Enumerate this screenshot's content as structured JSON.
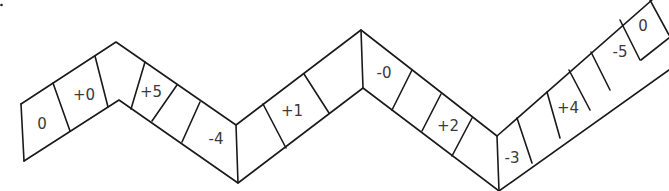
{
  "board": {
    "type": "zigzag number track",
    "cells": [
      {
        "index": 0,
        "label": "0",
        "x": 42,
        "y": 124
      },
      {
        "index": 1,
        "label": "+0",
        "x": 84,
        "y": 95
      },
      {
        "index": 2,
        "label": "",
        "x": 122,
        "y": 72
      },
      {
        "index": 3,
        "label": "+5",
        "x": 151,
        "y": 92
      },
      {
        "index": 4,
        "label": "",
        "x": 176,
        "y": 112
      },
      {
        "index": 5,
        "label": "-4",
        "x": 216,
        "y": 139
      },
      {
        "index": 6,
        "label": "",
        "x": 252,
        "y": 140
      },
      {
        "index": 7,
        "label": "+1",
        "x": 292,
        "y": 111
      },
      {
        "index": 8,
        "label": "",
        "x": 336,
        "y": 80
      },
      {
        "index": 9,
        "label": "-0",
        "x": 384,
        "y": 72
      },
      {
        "index": 10,
        "label": "",
        "x": 417,
        "y": 100
      },
      {
        "index": 11,
        "label": "+2",
        "x": 448,
        "y": 126
      },
      {
        "index": 12,
        "label": "",
        "x": 478,
        "y": 150
      },
      {
        "index": 13,
        "label": "-3",
        "x": 512,
        "y": 158
      },
      {
        "index": 14,
        "label": "",
        "x": 538,
        "y": 136
      },
      {
        "index": 15,
        "label": "+4",
        "x": 568,
        "y": 108
      },
      {
        "index": 16,
        "label": "",
        "x": 592,
        "y": 85
      },
      {
        "index": 17,
        "label": "-5",
        "x": 620,
        "y": 53
      },
      {
        "index": 18,
        "label": "0",
        "x": 643,
        "y": 26
      }
    ]
  }
}
